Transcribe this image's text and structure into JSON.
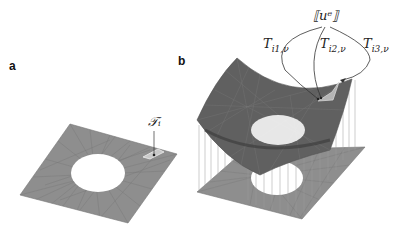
{
  "figure": {
    "panels": [
      {
        "label": "a",
        "description": "Flat triangulated square plate with a circular hole; a highlighted element is annotated",
        "annotation": "𝒯ᵢ"
      },
      {
        "label": "b",
        "description": "Same meshed plate lifted into a curved saddle-like surface above the flat mesh, connected by vertical lines; highlighted element linked to jump value",
        "top_label": "⟦uᵉ⟧",
        "edge_labels": [
          "T",
          "T",
          "T"
        ],
        "edge_label_subscripts": [
          "i1,ν",
          "i2,ν",
          "i3,ν"
        ]
      }
    ],
    "colors": {
      "mesh_fill": "#8c8c8c",
      "mesh_lines": "#6e6e6e",
      "surface_fill": "#5e5e5e",
      "highlight": "#c8c8c8",
      "annotation": "#333333"
    }
  }
}
